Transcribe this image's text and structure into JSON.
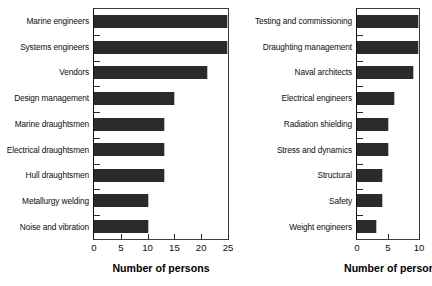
{
  "chart_data": [
    {
      "type": "bar",
      "orientation": "horizontal",
      "panel": "left",
      "title": "",
      "xlabel": "Number of persons",
      "ylabel": "",
      "categories": [
        "Marine engineers",
        "Systems engineers",
        "Vendors",
        "Design management",
        "Marine draughtsmen",
        "Electrical draughtsmen",
        "Hull draughtsmen",
        "Metallurgy welding",
        "Noise and vibration"
      ],
      "values": [
        25,
        25,
        21,
        15,
        13,
        13,
        13,
        10,
        10
      ],
      "xlim": [
        0,
        25
      ],
      "xticks": [
        0,
        5,
        10,
        15,
        20,
        25
      ],
      "xtick_labels": [
        "0",
        "5",
        "10",
        "15",
        "20",
        "25"
      ],
      "grid": false,
      "bar_color": "#2b2b2b"
    },
    {
      "type": "bar",
      "orientation": "horizontal",
      "panel": "right",
      "title": "",
      "xlabel": "Number of persons",
      "ylabel": "",
      "categories": [
        "Testing and commissioning",
        "Draughting management",
        "Naval architects",
        "Electrical engineers",
        "Radiation shielding",
        "Stress and dynamics",
        "Structural",
        "Safety",
        "Weight engineers"
      ],
      "values": [
        10,
        10,
        9,
        6,
        5,
        5,
        4,
        4,
        3
      ],
      "xlim": [
        0,
        10
      ],
      "xticks": [
        0,
        5,
        10
      ],
      "xtick_labels": [
        "0",
        "5",
        "10"
      ],
      "grid": false,
      "bar_color": "#2b2b2b"
    }
  ]
}
